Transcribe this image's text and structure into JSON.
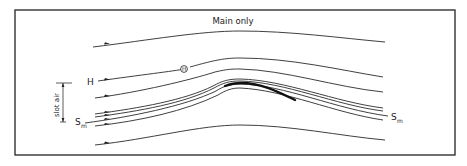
{
  "diagram": {
    "title": "Main only",
    "labels": {
      "h_label": "H",
      "marker_label": "H",
      "slot_air": "slot air",
      "stagnation_left": "S",
      "stagnation_left_sub": "m",
      "stagnation_right": "S",
      "stagnation_right_sub": "m"
    },
    "elements": {
      "streamline_count": 8,
      "airfoil": "main element (no slat)",
      "flow_direction": "left-to-right"
    },
    "colors": {
      "line": "#2a2a2a",
      "background": "#ffffff"
    }
  }
}
